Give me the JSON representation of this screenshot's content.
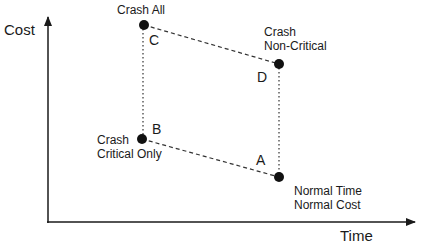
{
  "diagram": {
    "type": "time-cost-tradeoff",
    "axes": {
      "x_label": "Time",
      "y_label": "Cost"
    },
    "points": [
      {
        "id": "A",
        "letter": "A",
        "caption_lines": [
          "Normal Time",
          "Normal Cost"
        ],
        "time": "high",
        "cost": "low"
      },
      {
        "id": "B",
        "letter": "B",
        "caption_lines": [
          "Crash",
          "Critical Only"
        ],
        "time": "low",
        "cost": "mid-low"
      },
      {
        "id": "C",
        "letter": "C",
        "caption_lines": [
          "Crash All"
        ],
        "time": "low",
        "cost": "high"
      },
      {
        "id": "D",
        "letter": "D",
        "caption_lines": [
          "Crash",
          "Non-Critical"
        ],
        "time": "high",
        "cost": "mid-high"
      }
    ],
    "connections": [
      {
        "from": "C",
        "to": "D",
        "style": "dashed"
      },
      {
        "from": "B",
        "to": "A",
        "style": "dashed"
      },
      {
        "from": "C",
        "to": "B",
        "style": "dotted"
      },
      {
        "from": "D",
        "to": "A",
        "style": "dotted"
      }
    ],
    "colors": {
      "ink": "#1a1a1a",
      "background": "#ffffff"
    }
  }
}
